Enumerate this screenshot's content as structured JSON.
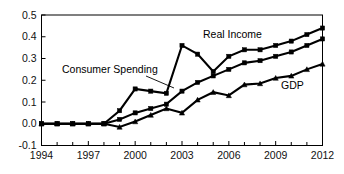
{
  "chart_data": {
    "type": "line",
    "title": "",
    "subtitle": "",
    "xlabel": "",
    "ylabel": "",
    "xlim": [
      1994,
      2012
    ],
    "ylim": [
      -0.1,
      0.5
    ],
    "grid": false,
    "legend_position": "inline-annotations",
    "x": [
      1994,
      1995,
      1996,
      1997,
      1998,
      1999,
      2000,
      2001,
      2002,
      2003,
      2004,
      2005,
      2006,
      2007,
      2008,
      2009,
      2010,
      2011,
      2012
    ],
    "ytick_labels": [
      "0.5",
      "0.4",
      "0.3",
      "0.2",
      "0.1",
      "0.0",
      "-0.1"
    ],
    "ytick_values": [
      0.5,
      0.4,
      0.3,
      0.2,
      0.1,
      0.0,
      -0.1
    ],
    "xtick_labels": [
      "1994",
      "1997",
      "2000",
      "2003",
      "2006",
      "2009",
      "2012"
    ],
    "xtick_values": [
      1994,
      1997,
      2000,
      2003,
      2006,
      2009,
      2012
    ],
    "xtick_minor_values": [
      1995,
      1996,
      1998,
      1999,
      2001,
      2002,
      2004,
      2005,
      2007,
      2008,
      2010,
      2011
    ],
    "series": [
      {
        "name": "Consumer Spending",
        "marker": "square",
        "values": [
          0.0,
          0.0,
          0.0,
          0.0,
          0.0,
          0.06,
          0.16,
          0.15,
          0.14,
          0.36,
          0.32,
          0.24,
          0.31,
          0.34,
          0.34,
          0.36,
          0.38,
          0.41,
          0.44
        ]
      },
      {
        "name": "Real Income",
        "marker": "square",
        "values": [
          0.0,
          0.0,
          0.0,
          0.0,
          0.0,
          0.02,
          0.05,
          0.07,
          0.09,
          0.15,
          0.19,
          0.22,
          0.25,
          0.28,
          0.29,
          0.31,
          0.33,
          0.36,
          0.39
        ]
      },
      {
        "name": "GDP",
        "marker": "triangle",
        "values": [
          0.0,
          0.0,
          0.0,
          0.0,
          0.0,
          -0.015,
          0.01,
          0.04,
          0.07,
          0.05,
          0.11,
          0.145,
          0.13,
          0.18,
          0.185,
          0.21,
          0.22,
          0.25,
          0.275
        ]
      }
    ],
    "annotations": [
      {
        "name": "consumer-spending-label",
        "text": "Consumer Spending",
        "x_px": 62,
        "y_px": 73,
        "leader": {
          "x1": 146,
          "y1": 76,
          "x2": 174,
          "y2": 88
        }
      },
      {
        "name": "real-income-label",
        "text": "Real Income",
        "x_px": 203,
        "y_px": 38,
        "leader": null
      },
      {
        "name": "gdp-label",
        "text": "GDP",
        "x_px": 281,
        "y_px": 89,
        "leader": null
      }
    ],
    "colors": {
      "line": "#000000",
      "axis": "#000000",
      "background": "#ffffff",
      "text": "#111111"
    }
  }
}
